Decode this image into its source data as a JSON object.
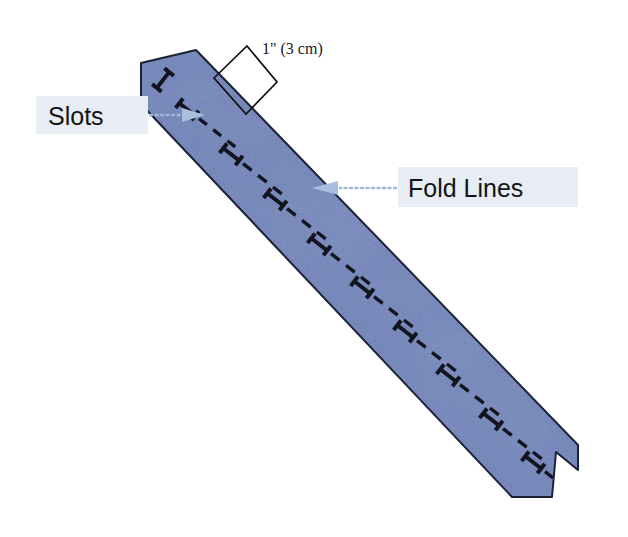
{
  "figure": {
    "background_color": "#ffffff"
  },
  "strip": {
    "name": "paper-strip",
    "material_color": "#7b8fc4",
    "highlight_color": "#a9b9dd",
    "shadow_color": "#66789f",
    "edge_color": "#1b2236",
    "orientation": "diagonal top-left to bottom-right",
    "end_top": "angled cut",
    "end_bottom": "v-notch cut",
    "slot_count": 11,
    "fold_line_count": 10,
    "fold_line_style": "dashed",
    "slot_mark_style": "i-beam",
    "slot_mark_color": "#12151f",
    "fold_line_color": "#12151f"
  },
  "dimension": {
    "name": "width-dimension",
    "label": "1\" (3 cm)",
    "marker_shape": "square-outline",
    "marker_color": "#111111",
    "text_x": 262,
    "text_y": 54
  },
  "annotations": [
    {
      "id": "slots",
      "label": "Slots",
      "box_color": "#e8edf5",
      "arrow_color": "#a8c0dd",
      "arrow_direction": "right",
      "box_x": 36,
      "box_y": 96,
      "box_w": 112,
      "box_h": 38,
      "text_x": 48,
      "text_y": 124,
      "font_size": 25,
      "dots_x1": 150,
      "dots_x2": 182,
      "dots_y": 115,
      "head_x": 184,
      "head_y": 115
    },
    {
      "id": "fold-lines",
      "label": "Fold Lines",
      "box_color": "#e8edf5",
      "arrow_color": "#a8c0dd",
      "arrow_direction": "left",
      "box_x": 398,
      "box_y": 167,
      "box_w": 180,
      "box_h": 40,
      "text_x": 408,
      "text_y": 197,
      "font_size": 25,
      "dots_x1": 336,
      "dots_x2": 396,
      "dots_y": 188,
      "head_x": 334,
      "head_y": 188
    }
  ]
}
